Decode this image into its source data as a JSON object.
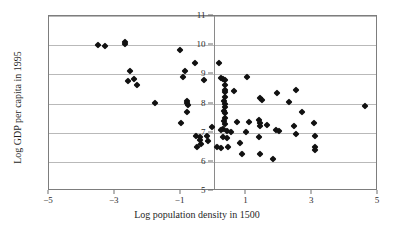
{
  "chart_data": {
    "type": "scatter",
    "title": "",
    "xlabel": "Log population density in 1500",
    "ylabel": "Log GDP per capita in 1995",
    "xlim": [
      -5,
      5
    ],
    "ylim": [
      5,
      11
    ],
    "xticks": [
      -5,
      -3,
      -1,
      1,
      3,
      5
    ],
    "xtick_labels": [
      "−5",
      "−3",
      "−1",
      "1",
      "3",
      "5"
    ],
    "yticks": [
      5,
      6,
      7,
      8,
      9,
      10,
      11
    ],
    "ytick_labels": [
      "5",
      "6",
      "7",
      "8",
      "9",
      "10",
      "11"
    ],
    "grid": "horizontal",
    "legend": "none",
    "marker": "diamond",
    "marker_color": "#111111",
    "grid_color": "#b9b9b9",
    "frame_color": "#7d7d7d",
    "zero_axis": 0,
    "points": [
      [
        -3.5,
        10.02
      ],
      [
        -3.3,
        9.96
      ],
      [
        -2.68,
        10.12
      ],
      [
        -2.68,
        10.05
      ],
      [
        -2.55,
        9.1
      ],
      [
        -2.6,
        8.78
      ],
      [
        -2.42,
        8.85
      ],
      [
        -2.32,
        8.62
      ],
      [
        -1.78,
        8.02
      ],
      [
        -1.02,
        9.82
      ],
      [
        -0.88,
        9.12
      ],
      [
        -0.92,
        8.92
      ],
      [
        -0.8,
        8.1
      ],
      [
        -0.8,
        8.02
      ],
      [
        -0.78,
        7.95
      ],
      [
        -0.82,
        7.72
      ],
      [
        -1.0,
        7.32
      ],
      [
        -0.56,
        9.38
      ],
      [
        -0.3,
        8.8
      ],
      [
        -0.52,
        6.88
      ],
      [
        -0.4,
        6.86
      ],
      [
        -0.42,
        6.74
      ],
      [
        -0.38,
        6.62
      ],
      [
        -0.5,
        6.52
      ],
      [
        -0.2,
        6.9
      ],
      [
        -0.16,
        6.7
      ],
      [
        -0.05,
        7.18
      ],
      [
        0.1,
        6.5
      ],
      [
        0.18,
        9.38
      ],
      [
        0.22,
        8.88
      ],
      [
        0.3,
        8.84
      ],
      [
        0.34,
        8.8
      ],
      [
        0.36,
        8.62
      ],
      [
        0.34,
        8.48
      ],
      [
        0.36,
        8.38
      ],
      [
        0.34,
        8.22
      ],
      [
        0.33,
        8.08
      ],
      [
        0.35,
        7.98
      ],
      [
        0.34,
        7.88
      ],
      [
        0.33,
        7.76
      ],
      [
        0.35,
        7.66
      ],
      [
        0.34,
        7.52
      ],
      [
        0.33,
        7.4
      ],
      [
        0.35,
        7.3
      ],
      [
        0.3,
        7.14
      ],
      [
        0.22,
        7.1
      ],
      [
        0.4,
        7.06
      ],
      [
        0.52,
        7.02
      ],
      [
        0.28,
        6.86
      ],
      [
        0.4,
        6.82
      ],
      [
        0.22,
        6.48
      ],
      [
        0.44,
        6.5
      ],
      [
        0.62,
        8.42
      ],
      [
        0.7,
        7.38
      ],
      [
        0.8,
        6.66
      ],
      [
        0.86,
        6.26
      ],
      [
        1.02,
        8.92
      ],
      [
        1.0,
        7.04
      ],
      [
        1.08,
        7.38
      ],
      [
        1.42,
        8.18
      ],
      [
        1.48,
        8.12
      ],
      [
        1.38,
        7.42
      ],
      [
        1.4,
        7.32
      ],
      [
        1.42,
        7.22
      ],
      [
        1.38,
        6.86
      ],
      [
        1.42,
        6.28
      ],
      [
        1.62,
        7.26
      ],
      [
        1.82,
        6.1
      ],
      [
        1.92,
        8.36
      ],
      [
        1.9,
        7.08
      ],
      [
        1.98,
        7.06
      ],
      [
        2.3,
        8.04
      ],
      [
        2.46,
        7.22
      ],
      [
        2.52,
        8.46
      ],
      [
        2.52,
        6.96
      ],
      [
        2.7,
        7.7
      ],
      [
        3.06,
        7.32
      ],
      [
        3.08,
        6.88
      ],
      [
        3.1,
        6.52
      ],
      [
        3.1,
        6.42
      ],
      [
        4.62,
        7.92
      ]
    ]
  }
}
